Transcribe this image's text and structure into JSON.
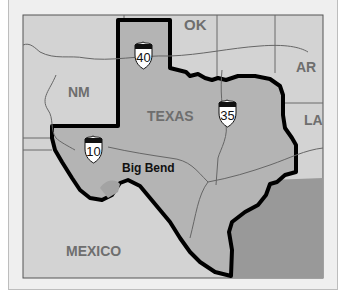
{
  "caption": "TO  IT  LET",
  "map": {
    "title": "Texas locator map",
    "colors": {
      "background": "#efefef",
      "neighbor_land": "#d3d3d3",
      "texas_fill": "#b4b4b4",
      "gulf_water": "#999999",
      "outline": "#000000",
      "rivers_roads": "#666666",
      "label_gray": "#6e6e6e"
    },
    "regions": {
      "ok": "OK",
      "ar": "AR",
      "nm": "NM",
      "la": "LA",
      "texas": "TEXAS",
      "mexico": "MEXICO"
    },
    "places": {
      "big_bend": "Big Bend"
    },
    "highways": [
      {
        "id": "i40",
        "number": "40"
      },
      {
        "id": "i35",
        "number": "35"
      },
      {
        "id": "i10",
        "number": "10"
      }
    ]
  }
}
